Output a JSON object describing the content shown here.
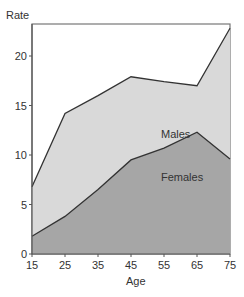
{
  "chart_data": {
    "type": "area",
    "title": "",
    "xlabel": "Age",
    "ylabel": "Rate",
    "x": [
      15,
      25,
      35,
      45,
      55,
      65,
      75
    ],
    "xlim": [
      15,
      75
    ],
    "ylim": [
      0,
      23
    ],
    "xticks": [
      "15",
      "25",
      "35",
      "45",
      "55",
      "65",
      "75"
    ],
    "yticks": [
      "0",
      "5",
      "10",
      "15",
      "20"
    ],
    "grid": false,
    "legend": "inline labels",
    "series": [
      {
        "name": "Males",
        "values": [
          6.8,
          14.2,
          16.0,
          17.9,
          17.4,
          17.0,
          22.8
        ],
        "color": "#d9d9d9"
      },
      {
        "name": "Females",
        "values": [
          1.8,
          3.8,
          6.5,
          9.5,
          10.7,
          12.3,
          9.6
        ],
        "color": "#a6a6a6"
      }
    ]
  },
  "labels": {
    "males": "Males",
    "females": "Females",
    "xlabel": "Age",
    "ylabel": "Rate"
  },
  "colors": {
    "males_fill": "#d9d9d9",
    "females_fill": "#a6a6a6",
    "line": "#333333",
    "frame": "#777777"
  }
}
